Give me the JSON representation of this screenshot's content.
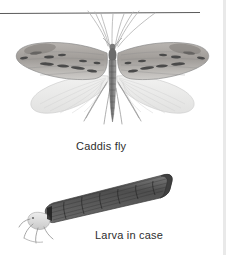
{
  "figure": {
    "type": "scientific-illustration-plate",
    "background_color": "#ffffff",
    "rule_color": "#5a5a5a",
    "caption_color": "#2e2e2e",
    "specimen_color_dark": "#6f6f6f",
    "specimen_color_mid": "#9a9a9a",
    "specimen_color_light": "#d8d8d8",
    "case_color": "#575757"
  },
  "labels": {
    "caddis_fly": "Caddis fly",
    "larva_in_case": "Larva in case"
  },
  "illustrations": {
    "adult": {
      "name": "caddis-fly-adult",
      "description": "Adult caddis fly with spread forewings and hindwings, long antennae and legs"
    },
    "larva": {
      "name": "caddis-larva-in-case",
      "description": "Caddisfly larva protruding from a tapered segmented case"
    }
  },
  "divider": {
    "name": "top-rule",
    "visible": true
  }
}
